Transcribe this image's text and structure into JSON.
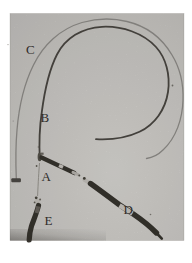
{
  "figure": {
    "labels": {
      "a": "A",
      "b": "B",
      "c": "C",
      "d": "D",
      "e": "E"
    }
  },
  "colors": {
    "paper_white": "#ffffff",
    "photo_light": "#d8d6d2",
    "photo_mid": "#cccac6",
    "photo_dark": "#c2c0bd",
    "tendril_thin": "#8f8d89",
    "tendril_dark": "#4a4742",
    "segment_dark": "#37342e",
    "segment_light": "#c9c6c0",
    "knob_light": "#c4c1bb",
    "anchor_dark": "#4c4945",
    "label_color": "#2e2c29"
  }
}
